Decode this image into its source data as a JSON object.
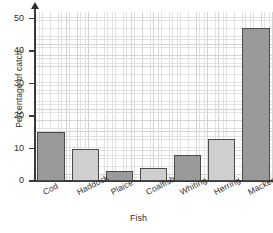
{
  "chart_data": {
    "type": "bar",
    "title": "",
    "xlabel": "Fish",
    "ylabel": "Percentage of catch",
    "categories": [
      "Cod",
      "Haddock",
      "Plaice",
      "Coalfish",
      "Whiting",
      "Herring",
      "Mackerel"
    ],
    "values": [
      15,
      10,
      3,
      4,
      8,
      13,
      47
    ],
    "ylim": [
      0,
      52
    ],
    "ytick_labels": [
      "0",
      "10",
      "20",
      "30",
      "40",
      "50"
    ],
    "ytick_values": [
      0,
      10,
      20,
      30,
      40,
      50
    ],
    "grid": true,
    "grid_minor": true,
    "legend": "none",
    "bar_colors": [
      "#9a9a9a",
      "#cfcfcf",
      "#9a9a9a",
      "#cfcfcf",
      "#9a9a9a",
      "#cfcfcf",
      "#9a9a9a"
    ],
    "bar_edge_color": "#4a4a4a",
    "axis_color": "#3a3a3a",
    "grid_color": "#c9c9c9",
    "background": "#ffffff"
  }
}
